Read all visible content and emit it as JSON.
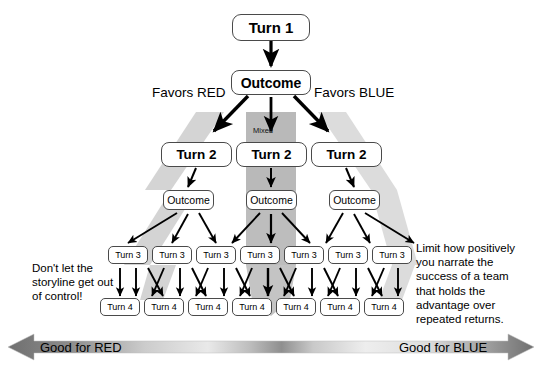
{
  "diagram": {
    "root": {
      "label": "Turn 1"
    },
    "root_outcome": {
      "label": "Outcome"
    },
    "branch_labels": {
      "left": "Favors RED",
      "right": "Favors BLUE",
      "center": "Mixed"
    },
    "turn2": [
      {
        "label": "Turn 2"
      },
      {
        "label": "Turn 2"
      },
      {
        "label": "Turn 2"
      }
    ],
    "outcome2": [
      {
        "label": "Outcome"
      },
      {
        "label": "Outcome"
      },
      {
        "label": "Outcome"
      }
    ],
    "turn3": [
      {
        "label": "Turn 3"
      },
      {
        "label": "Turn 3"
      },
      {
        "label": "Turn 3"
      },
      {
        "label": "Turn 3"
      },
      {
        "label": "Turn 3"
      },
      {
        "label": "Turn 3"
      },
      {
        "label": "Turn 3"
      }
    ],
    "turn4": [
      {
        "label": "Turn 4"
      },
      {
        "label": "Turn 4"
      },
      {
        "label": "Turn 4"
      },
      {
        "label": "Turn 4"
      },
      {
        "label": "Turn 4"
      },
      {
        "label": "Turn 4"
      },
      {
        "label": "Turn 4"
      }
    ],
    "notes": {
      "left": "Don't let the\nstoryline get out\nof control!",
      "left_lines": [
        "Don't let the",
        "storyline get out",
        "of control!"
      ],
      "right": "Limit how positively you narrate the success of a team that holds the advantage over repeated returns.",
      "right_lines": [
        "Limit how positively",
        "you narrate the",
        "success of a team",
        "that holds the",
        "advantage over",
        "repeated returns."
      ]
    },
    "spectrum_bar": {
      "left_label": "Good for RED",
      "right_label": "Good for BLUE"
    },
    "colors": {
      "background": "#ffffff",
      "node_border": "#4a4a4a",
      "text": "#000000",
      "band_light": "#d6d6d6",
      "band_mid": "#c2c2c2",
      "band_dark": "#a8a8a8",
      "arrow": "#000000",
      "bar_dark": "#7a7a7a",
      "bar_light": "#f2f2f2"
    }
  }
}
